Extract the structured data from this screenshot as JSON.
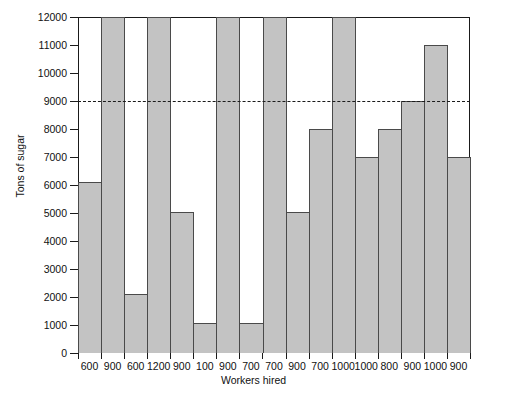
{
  "chart_data": {
    "type": "bar",
    "title": "",
    "subtitle": "",
    "xlabel": "Workers hired",
    "ylabel": "Tons of sugar",
    "categories": [
      "600",
      "900",
      "600",
      "1200",
      "900",
      "100",
      "900",
      "700",
      "700",
      "900",
      "700",
      "1000",
      "1000",
      "800",
      "900",
      "1000",
      "900"
    ],
    "values": [
      6100,
      12000,
      2100,
      12000,
      5050,
      1080,
      12000,
      1080,
      12000,
      5050,
      8000,
      12000,
      7000,
      8000,
      9000,
      11000,
      7000
    ],
    "ylim": [
      0,
      12000
    ],
    "yticks": [
      0,
      1000,
      2000,
      3000,
      4000,
      5000,
      6000,
      7000,
      8000,
      9000,
      10000,
      11000,
      12000
    ],
    "ytick_labels": [
      "0",
      "1000",
      "2000",
      "3000",
      "4000",
      "5000",
      "6000",
      "7000",
      "8000",
      "9000",
      "10000",
      "11000",
      "12000"
    ],
    "grid": false,
    "legend": null,
    "annotations": [
      {
        "name": "threshold-line",
        "type": "horizontal-dashed-line",
        "value": 9000,
        "label": ""
      }
    ],
    "bar_fill_color": "#c3c3c3",
    "bar_edge_color": "#4a4a4a",
    "axis_color": "#1a1a1a",
    "background_color": "#ffffff"
  }
}
